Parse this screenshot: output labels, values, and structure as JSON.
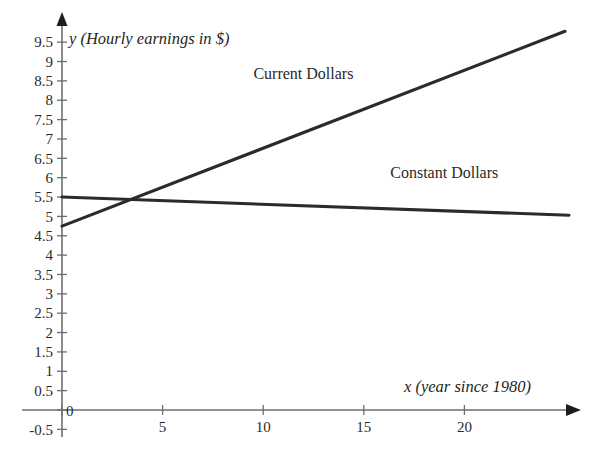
{
  "chart_data": {
    "type": "line",
    "title": "",
    "xlabel": "x (year since 1980)",
    "ylabel": "y (Hourly earnings in $)",
    "xlim": [
      0,
      25.8
    ],
    "ylim": [
      -0.5,
      9.8
    ],
    "grid": false,
    "legend": "inline-labels",
    "x_ticks": [
      0,
      5,
      10,
      15,
      20
    ],
    "x_tick_labels": [
      "0",
      "5",
      "10",
      "15",
      "20"
    ],
    "y_ticks": [
      -0.5,
      0,
      0.5,
      1,
      1.5,
      2,
      2.5,
      3,
      3.5,
      4,
      4.5,
      5,
      5.5,
      6,
      6.5,
      7,
      7.5,
      8,
      8.5,
      9,
      9.5
    ],
    "y_tick_labels": [
      "-0.5",
      "0",
      "0.5",
      "1",
      "1.5",
      "2",
      "2.5",
      "3",
      "3.5",
      "4",
      "4.5",
      "5",
      "5.5",
      "6",
      "6.5",
      "7",
      "7.5",
      "8",
      "8.5",
      "9",
      "9.5"
    ],
    "origin_label": "0",
    "series": [
      {
        "name": "Current Dollars",
        "label": "Current Dollars",
        "color": "#2b2b2b",
        "x": [
          0,
          25.0
        ],
        "values": [
          4.75,
          9.78
        ],
        "slope": 0.201,
        "intercept": 4.75,
        "label_x": 12.0,
        "label_y": 8.55
      },
      {
        "name": "Constant Dollars",
        "label": "Constant Dollars",
        "color": "#2b2b2b",
        "x": [
          0,
          25.2
        ],
        "values": [
          5.5,
          5.03
        ],
        "slope": -0.0187,
        "intercept": 5.5,
        "label_x": 19.0,
        "label_y": 6.0
      }
    ],
    "intersection": {
      "x": 3.4,
      "y": 5.44
    }
  },
  "axes": {
    "y_axis_title": "y (Hourly earnings in $)",
    "x_axis_title": "x (year since 1980)"
  }
}
